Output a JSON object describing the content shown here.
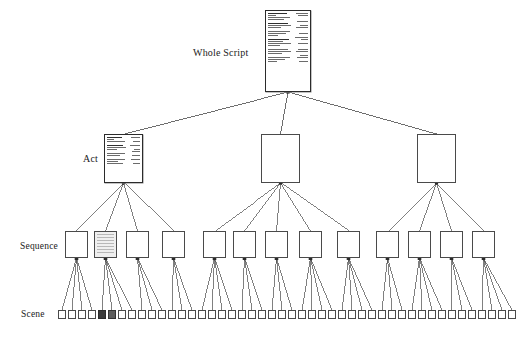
{
  "diagram": {
    "background": "#ffffff",
    "line_color": "#4a4a4a",
    "levels": [
      {
        "key": "whole_script",
        "label": "Whole Script",
        "count": 1
      },
      {
        "key": "act",
        "label": "Act",
        "count": 3
      },
      {
        "key": "sequence",
        "label": "Sequence",
        "count": 13
      },
      {
        "key": "scene",
        "label": "Scene",
        "count": 46
      }
    ]
  },
  "labels": {
    "whole_script": "Whole Script",
    "act": "Act",
    "sequence": "Sequence",
    "scene": "Scene"
  },
  "nodes": {
    "whole_script": {
      "type": "document",
      "x": 265,
      "y": 10,
      "w": 46,
      "h": 82,
      "column_left_lines": [
        {
          "len": 74,
          "bold": true
        },
        {
          "len": 30,
          "bold": false
        },
        {
          "len": 88,
          "bold": false
        },
        {
          "len": 62,
          "bold": false
        },
        {
          "len": 0,
          "bold": false
        },
        {
          "len": 80,
          "bold": true
        },
        {
          "len": 90,
          "bold": false
        },
        {
          "len": 52,
          "bold": false
        },
        {
          "len": 0,
          "bold": false
        },
        {
          "len": 86,
          "bold": false
        },
        {
          "len": 70,
          "bold": false
        },
        {
          "len": 40,
          "bold": false
        },
        {
          "len": 0,
          "bold": false
        },
        {
          "len": 84,
          "bold": true
        },
        {
          "len": 60,
          "bold": false
        },
        {
          "len": 90,
          "bold": false
        },
        {
          "len": 46,
          "bold": false
        },
        {
          "len": 0,
          "bold": false
        },
        {
          "len": 78,
          "bold": false
        },
        {
          "len": 92,
          "bold": false
        },
        {
          "len": 55,
          "bold": false
        },
        {
          "len": 0,
          "bold": false
        },
        {
          "len": 88,
          "bold": false
        },
        {
          "len": 66,
          "bold": false
        },
        {
          "len": 36,
          "bold": false
        }
      ],
      "column_right_lines": [
        {
          "len": 80,
          "bold": false
        },
        {
          "len": 64,
          "bold": false
        },
        {
          "len": 0,
          "bold": false
        },
        {
          "len": 0,
          "bold": false
        },
        {
          "len": 72,
          "bold": false
        },
        {
          "len": 0,
          "bold": false
        },
        {
          "len": 56,
          "bold": false
        },
        {
          "len": 78,
          "bold": false
        },
        {
          "len": 0,
          "bold": false
        },
        {
          "len": 0,
          "bold": false
        },
        {
          "len": 62,
          "bold": false
        },
        {
          "len": 0,
          "bold": false
        },
        {
          "len": 84,
          "bold": false
        },
        {
          "len": 48,
          "bold": false
        },
        {
          "len": 0,
          "bold": false
        },
        {
          "len": 70,
          "bold": false
        },
        {
          "len": 0,
          "bold": false
        },
        {
          "len": 0,
          "bold": false
        },
        {
          "len": 66,
          "bold": false
        },
        {
          "len": 80,
          "bold": false
        },
        {
          "len": 0,
          "bold": false
        },
        {
          "len": 52,
          "bold": false
        },
        {
          "len": 74,
          "bold": false
        },
        {
          "len": 0,
          "bold": false
        },
        {
          "len": 60,
          "bold": false
        }
      ]
    },
    "acts": [
      {
        "type": "document",
        "x": 104,
        "y": 134,
        "w": 39,
        "h": 49,
        "shaded": false
      },
      {
        "type": "box",
        "x": 261,
        "y": 134,
        "w": 39,
        "h": 49,
        "shaded": false
      },
      {
        "type": "box",
        "x": 417,
        "y": 134,
        "w": 39,
        "h": 49,
        "shaded": false
      }
    ],
    "act_doc_left_lines": [
      {
        "len": 70,
        "bold": true
      },
      {
        "len": 34,
        "bold": false
      },
      {
        "len": 86,
        "bold": false
      },
      {
        "len": 0,
        "bold": false
      },
      {
        "len": 78,
        "bold": true
      },
      {
        "len": 90,
        "bold": false
      },
      {
        "len": 48,
        "bold": false
      },
      {
        "len": 0,
        "bold": false
      },
      {
        "len": 84,
        "bold": false
      },
      {
        "len": 64,
        "bold": false
      },
      {
        "len": 0,
        "bold": false
      },
      {
        "len": 88,
        "bold": false
      },
      {
        "len": 54,
        "bold": false
      },
      {
        "len": 76,
        "bold": false
      }
    ],
    "act_doc_right_lines": [
      {
        "len": 76,
        "bold": false
      },
      {
        "len": 0,
        "bold": false
      },
      {
        "len": 60,
        "bold": false
      },
      {
        "len": 0,
        "bold": false
      },
      {
        "len": 82,
        "bold": false
      },
      {
        "len": 0,
        "bold": false
      },
      {
        "len": 54,
        "bold": false
      },
      {
        "len": 70,
        "bold": false
      },
      {
        "len": 0,
        "bold": false
      },
      {
        "len": 66,
        "bold": false
      },
      {
        "len": 0,
        "bold": false
      },
      {
        "len": 78,
        "bold": false
      },
      {
        "len": 0,
        "bold": false
      },
      {
        "len": 58,
        "bold": false
      }
    ],
    "sequences": [
      {
        "x": 65,
        "y": 231,
        "shaded": false,
        "parent": 0
      },
      {
        "x": 94,
        "y": 231,
        "shaded": true,
        "parent": 0
      },
      {
        "x": 126,
        "y": 231,
        "shaded": false,
        "parent": 0
      },
      {
        "x": 162,
        "y": 231,
        "shaded": false,
        "parent": 0
      },
      {
        "x": 203,
        "y": 231,
        "shaded": false,
        "parent": 1
      },
      {
        "x": 233,
        "y": 231,
        "shaded": false,
        "parent": 1
      },
      {
        "x": 265,
        "y": 231,
        "shaded": false,
        "parent": 1
      },
      {
        "x": 299,
        "y": 231,
        "shaded": false,
        "parent": 1
      },
      {
        "x": 337,
        "y": 231,
        "shaded": false,
        "parent": 1
      },
      {
        "x": 376,
        "y": 231,
        "shaded": false,
        "parent": 2
      },
      {
        "x": 408,
        "y": 231,
        "shaded": false,
        "parent": 2
      },
      {
        "x": 440,
        "y": 231,
        "shaded": false,
        "parent": 2
      },
      {
        "x": 472,
        "y": 231,
        "shaded": false,
        "parent": 2
      }
    ],
    "scene_row": {
      "y": 310,
      "start_x": 58,
      "pitch": 10.0,
      "count": 46,
      "fill_states": [
        "empty",
        "empty",
        "empty",
        "empty",
        "dark",
        "mid",
        "empty",
        "empty",
        "empty",
        "empty",
        "empty",
        "empty",
        "empty",
        "empty",
        "empty",
        "empty",
        "empty",
        "empty",
        "empty",
        "empty",
        "empty",
        "empty",
        "empty",
        "empty",
        "empty",
        "empty",
        "empty",
        "empty",
        "empty",
        "empty",
        "empty",
        "empty",
        "empty",
        "empty",
        "empty",
        "empty",
        "empty",
        "empty",
        "empty",
        "empty",
        "empty",
        "empty",
        "empty",
        "empty",
        "empty",
        "empty"
      ],
      "scenes_per_sequence": [
        4,
        4,
        3,
        3,
        4,
        3,
        3,
        4,
        4,
        3,
        4,
        3,
        4
      ]
    }
  }
}
